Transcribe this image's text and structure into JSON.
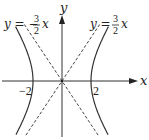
{
  "diagram": {
    "type": "hyperbola",
    "equation": "x^2/4 - y^2/9 = 1",
    "a": 2,
    "b": 3,
    "axes": {
      "x_label": "x",
      "y_label": "y"
    },
    "vertex_labels": {
      "left": "−2",
      "right": "2"
    },
    "asymptotes": [
      {
        "slope": -1.5,
        "label_prefix": "y = −",
        "num": "3",
        "den": "2",
        "var": "x",
        "position": "top-left"
      },
      {
        "slope": 1.5,
        "label_prefix": "y = ",
        "num": "3",
        "den": "2",
        "var": "x",
        "position": "top-right"
      }
    ],
    "x_range": [
      -4.2,
      5.2
    ],
    "y_range": [
      -3.8,
      4.5
    ],
    "colors": {
      "curve": "#333333",
      "axis": "#333333",
      "asymptote": "#444444"
    }
  }
}
